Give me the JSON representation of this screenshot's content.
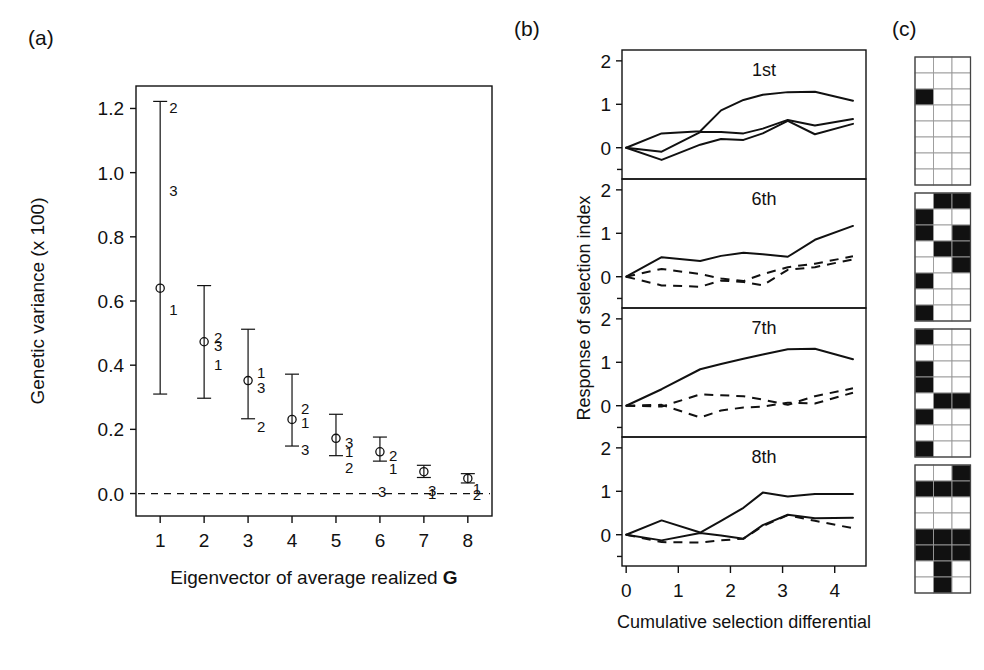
{
  "figure": {
    "width": 984,
    "height": 670,
    "background": "#ffffff",
    "ink_color": "#111111"
  },
  "panel_a": {
    "letter": "(a)",
    "xlabel_text": "Eigenvector of average realized",
    "xlabel_bold_suffix": "G",
    "ylabel": "Genetic variance (x 100)",
    "ytick_labels": [
      "1.2",
      "1.0",
      "0.8",
      "0.6",
      "0.4",
      "0.2",
      "0.0"
    ],
    "ytick_values": [
      1.2,
      1.0,
      0.8,
      0.6,
      0.4,
      0.2,
      0.0
    ],
    "xtick_labels": [
      "1",
      "2",
      "3",
      "4",
      "5",
      "6",
      "7",
      "8"
    ],
    "xtick_values": [
      1,
      2,
      3,
      4,
      5,
      6,
      7,
      8
    ],
    "zero_reference_line": "dashed at y = 0.0"
  },
  "panel_b": {
    "letter": "(b)",
    "ylabel": "Response of selection index",
    "xlabel": "Cumulative selection differential",
    "xtick_labels": [
      "0",
      "1",
      "2",
      "3",
      "4"
    ],
    "xtick_values": [
      0,
      1,
      2,
      3,
      4
    ],
    "ytick_labels": [
      "0",
      "1",
      "2"
    ],
    "ytick_values": [
      0,
      1,
      2
    ],
    "subplot_labels": [
      "1st",
      "6th",
      "7th",
      "8th"
    ]
  },
  "panel_c": {
    "letter": "(c)"
  },
  "chart_data": [
    {
      "type": "scatter",
      "id": "panel-a-eigenvalue-scree",
      "title": "",
      "xlabel": "Eigenvector of average realized G",
      "ylabel": "Genetic variance (x 100)",
      "xlim": [
        0.45,
        8.55
      ],
      "ylim": [
        -0.07,
        1.27
      ],
      "grid": false,
      "legend": "none",
      "x": [
        1,
        2,
        3,
        4,
        5,
        6,
        7,
        8
      ],
      "values": [
        0.64,
        0.473,
        0.352,
        0.231,
        0.172,
        0.13,
        0.068,
        0.047
      ],
      "err_low": [
        0.31,
        0.297,
        0.233,
        0.148,
        0.118,
        0.101,
        0.05,
        0.033
      ],
      "err_high": [
        1.222,
        0.648,
        0.512,
        0.372,
        0.247,
        0.176,
        0.088,
        0.062
      ],
      "replicate_annotations": [
        {
          "x": 1,
          "labels": [
            {
              "text": "2",
              "y": 1.205,
              "dx": 9
            },
            {
              "text": "3",
              "y": 0.945,
              "dx": 9
            },
            {
              "text": "1",
              "y": 0.575,
              "dx": 9
            }
          ]
        },
        {
          "x": 2,
          "labels": [
            {
              "text": "2",
              "y": 0.487,
              "dx": 10
            },
            {
              "text": "3",
              "y": 0.462,
              "dx": 10
            },
            {
              "text": "1",
              "y": 0.405,
              "dx": 10
            }
          ]
        },
        {
          "x": 3,
          "labels": [
            {
              "text": "1",
              "y": 0.38,
              "dx": 9
            },
            {
              "text": "3",
              "y": 0.332,
              "dx": 9
            },
            {
              "text": "2",
              "y": 0.21,
              "dx": 9
            }
          ]
        },
        {
          "x": 4,
          "labels": [
            {
              "text": "2",
              "y": 0.268,
              "dx": 9
            },
            {
              "text": "1",
              "y": 0.222,
              "dx": 9
            },
            {
              "text": "3",
              "y": 0.14,
              "dx": 9
            }
          ]
        },
        {
          "x": 5,
          "labels": [
            {
              "text": "3",
              "y": 0.162,
              "dx": 9
            },
            {
              "text": "1",
              "y": 0.134,
              "dx": 9
            },
            {
              "text": "2",
              "y": 0.082,
              "dx": 9
            }
          ]
        },
        {
          "x": 6,
          "labels": [
            {
              "text": "2",
              "y": 0.12,
              "dx": 9
            },
            {
              "text": "1",
              "y": 0.08,
              "dx": 9
            },
            {
              "text": "3",
              "y": 0.008,
              "dx": -2
            }
          ]
        },
        {
          "x": 7,
          "labels": [
            {
              "text": "3",
              "y": 0.01,
              "dx": 4
            },
            {
              "text": "1",
              "y": 0.003,
              "dx": 4
            }
          ]
        },
        {
          "x": 8,
          "labels": [
            {
              "text": "1",
              "y": 0.016,
              "dx": 5
            },
            {
              "text": "2",
              "y": 0.0,
              "dx": 5
            }
          ]
        }
      ],
      "zero_line": 0.0,
      "marker": "open-circle"
    },
    {
      "type": "line",
      "id": "panel-b-1st",
      "title": "1st",
      "xlabel": "Cumulative selection differential",
      "ylabel": "Response of selection index",
      "xlim": [
        -0.08,
        4.6
      ],
      "ylim": [
        -0.72,
        2.25
      ],
      "grid": false,
      "legend": "none",
      "series": [
        {
          "name": "line-1",
          "style": "solid",
          "x": [
            0.0,
            0.68,
            1.42,
            1.82,
            2.25,
            2.62,
            3.1,
            3.62,
            4.35
          ],
          "y": [
            0.0,
            0.33,
            0.38,
            0.86,
            1.1,
            1.22,
            1.28,
            1.29,
            1.08
          ]
        },
        {
          "name": "line-2",
          "style": "solid",
          "x": [
            0.0,
            0.68,
            1.42,
            1.82,
            2.25,
            2.62,
            3.1,
            3.62,
            4.35
          ],
          "y": [
            0.0,
            -0.09,
            0.36,
            0.36,
            0.33,
            0.44,
            0.64,
            0.51,
            0.66
          ]
        },
        {
          "name": "line-3",
          "style": "solid",
          "x": [
            0.0,
            0.68,
            1.42,
            1.82,
            2.25,
            2.62,
            3.1,
            3.62,
            4.35
          ],
          "y": [
            0.0,
            -0.28,
            0.07,
            0.2,
            0.18,
            0.33,
            0.62,
            0.31,
            0.55
          ]
        }
      ]
    },
    {
      "type": "line",
      "id": "panel-b-6th",
      "title": "6th",
      "xlabel": "Cumulative selection differential",
      "ylabel": "Response of selection index",
      "xlim": [
        -0.08,
        4.6
      ],
      "ylim": [
        -0.72,
        2.25
      ],
      "grid": false,
      "legend": "none",
      "series": [
        {
          "name": "line-1",
          "style": "solid",
          "x": [
            0.0,
            0.68,
            1.42,
            1.82,
            2.25,
            2.62,
            3.1,
            3.62,
            4.35
          ],
          "y": [
            0.0,
            0.45,
            0.36,
            0.48,
            0.55,
            0.52,
            0.46,
            0.85,
            1.17
          ]
        },
        {
          "name": "line-2",
          "style": "dashed",
          "x": [
            0.0,
            0.68,
            1.42,
            1.82,
            2.25,
            2.62,
            3.1,
            3.62,
            4.35
          ],
          "y": [
            0.0,
            0.18,
            0.06,
            -0.04,
            -0.1,
            0.06,
            0.22,
            0.3,
            0.47
          ]
        },
        {
          "name": "line-3",
          "style": "dashed",
          "x": [
            0.0,
            0.68,
            1.42,
            1.82,
            2.25,
            2.62,
            3.1,
            3.62,
            4.35
          ],
          "y": [
            0.0,
            -0.2,
            -0.23,
            -0.09,
            -0.12,
            -0.2,
            0.16,
            0.22,
            0.4
          ]
        }
      ]
    },
    {
      "type": "line",
      "id": "panel-b-7th",
      "title": "7th",
      "xlabel": "Cumulative selection differential",
      "ylabel": "Response of selection index",
      "xlim": [
        -0.08,
        4.6
      ],
      "ylim": [
        -0.72,
        2.25
      ],
      "grid": false,
      "legend": "none",
      "series": [
        {
          "name": "line-1",
          "style": "solid",
          "x": [
            0.0,
            0.68,
            1.42,
            1.82,
            2.25,
            2.62,
            3.1,
            3.62,
            4.35
          ],
          "y": [
            0.0,
            0.38,
            0.84,
            0.96,
            1.08,
            1.18,
            1.3,
            1.31,
            1.07
          ]
        },
        {
          "name": "line-2",
          "style": "dashed",
          "x": [
            0.0,
            0.68,
            1.42,
            1.82,
            2.25,
            2.62,
            3.1,
            3.62,
            4.35
          ],
          "y": [
            0.0,
            -0.02,
            0.26,
            0.24,
            0.22,
            0.14,
            0.02,
            0.22,
            0.4
          ]
        },
        {
          "name": "line-3",
          "style": "dashed",
          "x": [
            0.0,
            0.68,
            1.42,
            1.82,
            2.25,
            2.62,
            3.1,
            3.62,
            4.35
          ],
          "y": [
            0.0,
            0.02,
            -0.27,
            -0.11,
            -0.04,
            -0.02,
            0.07,
            0.05,
            0.3
          ]
        }
      ]
    },
    {
      "type": "line",
      "id": "panel-b-8th",
      "title": "8th",
      "xlabel": "Cumulative selection differential",
      "ylabel": "Response of selection index",
      "xlim": [
        -0.08,
        4.6
      ],
      "ylim": [
        -0.72,
        2.25
      ],
      "grid": false,
      "legend": "none",
      "series": [
        {
          "name": "line-1",
          "style": "solid",
          "x": [
            0.0,
            0.68,
            1.42,
            1.82,
            2.25,
            2.62,
            3.1,
            3.62,
            4.35
          ],
          "y": [
            0.0,
            0.33,
            0.05,
            0.32,
            0.62,
            0.97,
            0.88,
            0.94,
            0.94
          ]
        },
        {
          "name": "line-2",
          "style": "solid",
          "x": [
            0.0,
            0.68,
            1.42,
            1.82,
            2.25,
            2.62,
            3.1,
            3.62,
            4.35
          ],
          "y": [
            0.0,
            -0.13,
            0.04,
            -0.02,
            -0.09,
            0.22,
            0.46,
            0.38,
            0.39
          ]
        },
        {
          "name": "line-3",
          "style": "dashed",
          "x": [
            0.0,
            0.68,
            1.42,
            1.82,
            2.25,
            2.62,
            3.1,
            3.62,
            4.35
          ],
          "y": [
            0.0,
            -0.17,
            -0.18,
            -0.13,
            -0.09,
            0.2,
            0.45,
            0.32,
            0.15
          ]
        }
      ]
    },
    {
      "type": "heatmap",
      "id": "panel-c-binary-grids",
      "title": "",
      "xlabel": "",
      "ylabel": "",
      "grid": true,
      "legend": "none",
      "note": "Four stacked 3-column x 8-row binary matrices; 1 = filled black cell, 0 = white cell",
      "columns": 3,
      "rows": 8,
      "blocks": [
        {
          "name": "block-1",
          "cells": [
            [
              0,
              0,
              0
            ],
            [
              0,
              0,
              0
            ],
            [
              1,
              0,
              0
            ],
            [
              0,
              0,
              0
            ],
            [
              0,
              0,
              0
            ],
            [
              0,
              0,
              0
            ],
            [
              0,
              0,
              0
            ],
            [
              0,
              0,
              0
            ]
          ]
        },
        {
          "name": "block-2",
          "cells": [
            [
              0,
              1,
              1
            ],
            [
              1,
              0,
              0
            ],
            [
              1,
              0,
              1
            ],
            [
              0,
              1,
              1
            ],
            [
              0,
              0,
              1
            ],
            [
              1,
              0,
              0
            ],
            [
              0,
              0,
              0
            ],
            [
              1,
              0,
              0
            ]
          ]
        },
        {
          "name": "block-3",
          "cells": [
            [
              1,
              0,
              0
            ],
            [
              0,
              0,
              0
            ],
            [
              1,
              0,
              0
            ],
            [
              1,
              0,
              0
            ],
            [
              0,
              1,
              1
            ],
            [
              1,
              0,
              0
            ],
            [
              0,
              0,
              0
            ],
            [
              1,
              0,
              0
            ]
          ]
        },
        {
          "name": "block-4",
          "cells": [
            [
              0,
              0,
              1
            ],
            [
              1,
              1,
              1
            ],
            [
              0,
              0,
              0
            ],
            [
              0,
              0,
              0
            ],
            [
              1,
              1,
              1
            ],
            [
              1,
              1,
              1
            ],
            [
              0,
              1,
              0
            ],
            [
              0,
              1,
              0
            ]
          ]
        }
      ]
    }
  ]
}
